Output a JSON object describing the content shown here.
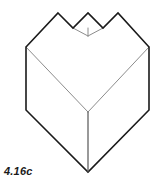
{
  "figure": {
    "caption": "4.16c",
    "colors": {
      "background": "#ffffff",
      "outline": "#1a1a1a",
      "interior_edge": "#8c8c8c",
      "caption": "#1a1a1a"
    },
    "stroke_widths": {
      "outline": 1.6,
      "interior_edge": 1.0
    },
    "vertices": {
      "top_left_peak": [
        58,
        13
      ],
      "notch_left_valley": [
        73,
        28
      ],
      "notch_center_peak": [
        88,
        13
      ],
      "notch_right_valley": [
        103,
        28
      ],
      "top_right_peak": [
        118,
        13
      ],
      "left_upper_corner": [
        26,
        47
      ],
      "right_upper_corner": [
        149,
        47
      ],
      "left_lower_corner": [
        26,
        110
      ],
      "right_lower_corner": [
        149,
        110
      ],
      "bottom_apex": [
        88,
        172
      ],
      "interior_junction": [
        88,
        112
      ],
      "notch_bottom_vertex": [
        88,
        36
      ]
    },
    "outline_path": "M 58 13 L 73 28 L 88 13 L 103 28 L 118 13 L 149 47 L 149 110 L 88 172 L 26 110 L 26 47 Z",
    "interior_edges": [
      {
        "name": "left-face-diagonal",
        "path": "M 26 47 L 88 112"
      },
      {
        "name": "right-face-diagonal",
        "path": "M 149 47 L 88 112"
      },
      {
        "name": "center-vertical-edge",
        "path": "M 88 112 L 88 172"
      },
      {
        "name": "notch-left-inner-edge",
        "path": "M 73 28 L 88 36"
      },
      {
        "name": "notch-right-inner-edge",
        "path": "M 103 28 L 88 36"
      },
      {
        "name": "notch-center-vertical",
        "path": "M 88 36 L 88 28"
      }
    ]
  }
}
